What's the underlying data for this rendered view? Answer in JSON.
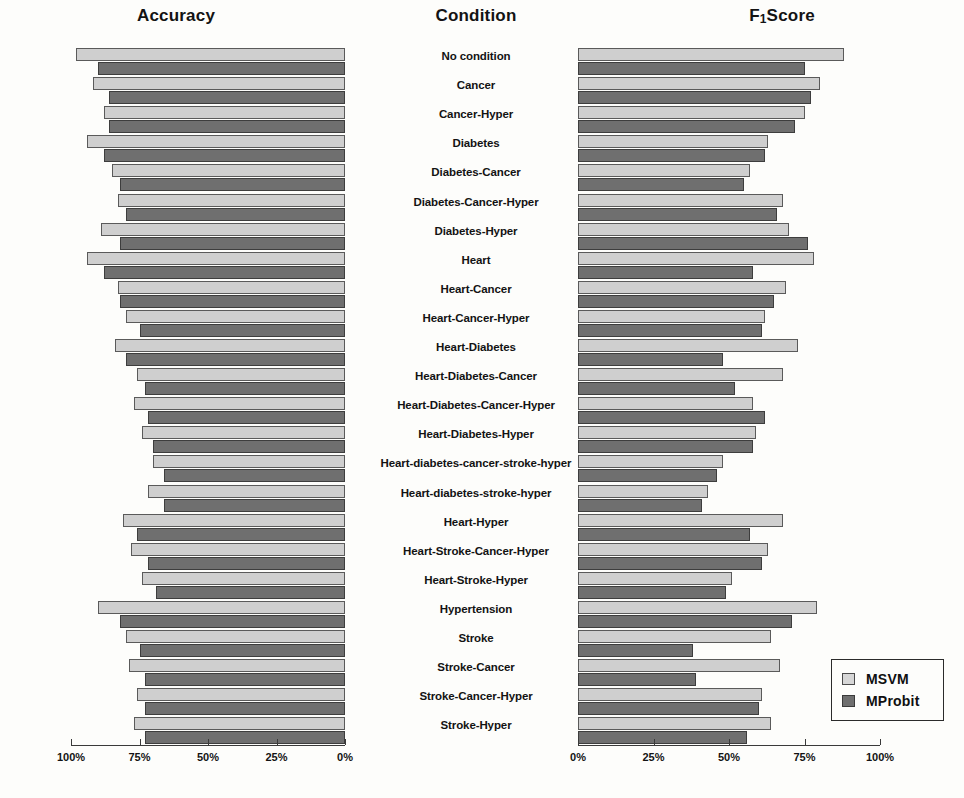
{
  "figure": {
    "left_panel_title": "Accuracy",
    "center_column_title": "Condition",
    "right_panel_title_main": "F",
    "right_panel_title_sub": "1",
    "right_panel_title_rest": "Score"
  },
  "legend": {
    "position": "bottom-right",
    "entries": [
      {
        "label": "MSVM",
        "color": "#d6d6d6"
      },
      {
        "label": "MProbit",
        "color": "#6f6f6f"
      }
    ]
  },
  "axes": {
    "accuracy_ticks": [
      "100%",
      "75%",
      "50%",
      "25%",
      "0%"
    ],
    "f1_ticks": [
      "0%",
      "25%",
      "50%",
      "75%",
      "100%"
    ],
    "accuracy_reversed": true
  },
  "chart_data": {
    "type": "bar",
    "orientation": "horizontal",
    "subtitle": "",
    "xlabel": "",
    "ylabel": "Condition",
    "grid": false,
    "legend_position": "bottom-right",
    "categories": [
      "No condition",
      "Cancer",
      "Cancer-Hyper",
      "Diabetes",
      "Diabetes-Cancer",
      "Diabetes-Cancer-Hyper",
      "Diabetes-Hyper",
      "Heart",
      "Heart-Cancer",
      "Heart-Cancer-Hyper",
      "Heart-Diabetes",
      "Heart-Diabetes-Cancer",
      "Heart-Diabetes-Cancer-Hyper",
      "Heart-Diabetes-Hyper",
      "Heart-diabetes-cancer-stroke-hyper",
      "Heart-diabetes-stroke-hyper",
      "Heart-Hyper",
      "Heart-Stroke-Cancer-Hyper",
      "Heart-Stroke-Hyper",
      "Hypertension",
      "Stroke",
      "Stroke-Cancer",
      "Stroke-Cancer-Hyper",
      "Stroke-Hyper"
    ],
    "panels": [
      {
        "name": "Accuracy",
        "xlim": [
          100,
          0
        ],
        "xticks": [
          100,
          75,
          50,
          25,
          0
        ],
        "series": [
          {
            "name": "MSVM",
            "color": "#cfcfcf",
            "values": [
              98,
              92,
              88,
              94,
              85,
              83,
              89,
              94,
              83,
              80,
              84,
              76,
              77,
              74,
              70,
              72,
              81,
              78,
              74,
              90,
              80,
              79,
              76,
              77
            ]
          },
          {
            "name": "MProbit",
            "color": "#6f6f6f",
            "values": [
              90,
              86,
              86,
              88,
              82,
              80,
              82,
              88,
              82,
              75,
              80,
              73,
              72,
              70,
              66,
              66,
              76,
              72,
              69,
              82,
              75,
              73,
              73,
              73
            ]
          }
        ]
      },
      {
        "name": "F1Score",
        "xlim": [
          0,
          100
        ],
        "xticks": [
          0,
          25,
          50,
          75,
          100
        ],
        "series": [
          {
            "name": "MSVM",
            "color": "#cfcfcf",
            "values": [
              88,
              80,
              75,
              63,
              57,
              68,
              70,
              78,
              69,
              62,
              73,
              68,
              58,
              59,
              48,
              43,
              68,
              63,
              51,
              79,
              64,
              67,
              61,
              64
            ]
          },
          {
            "name": "MProbit",
            "color": "#6f6f6f",
            "values": [
              75,
              77,
              72,
              62,
              55,
              66,
              76,
              58,
              65,
              61,
              48,
              52,
              62,
              58,
              46,
              41,
              57,
              61,
              49,
              71,
              38,
              39,
              60,
              56
            ]
          }
        ]
      }
    ]
  }
}
